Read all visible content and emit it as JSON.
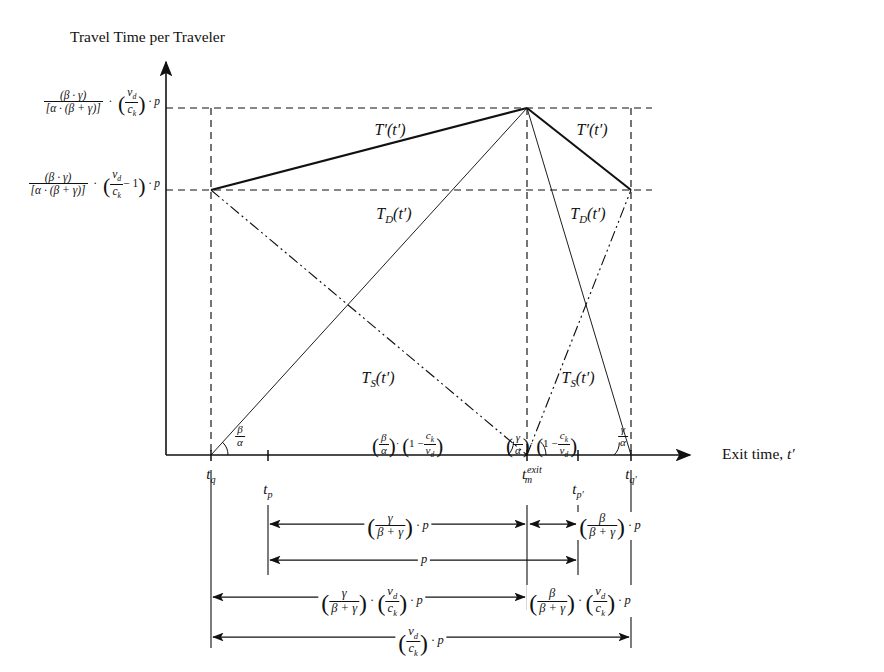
{
  "figure": {
    "domain": "diagram",
    "axes": {
      "y_title": "Travel Time per Traveler",
      "x_title_text": "Exit time, ",
      "x_title_var": "t′"
    },
    "y_ticks": [
      {
        "id": "y-upper",
        "value_desc": "[(β·γ)/(α·(β+γ))]·(v_d/c_k)·p",
        "num": "(β · γ)",
        "den": "[α · (β + γ)]",
        "f2_num": "v",
        "f2_num_sub": "d",
        "f2_den": "c",
        "f2_den_sub": "k",
        "tail": "· p",
        "y_px": 108
      },
      {
        "id": "y-lower",
        "value_desc": "[(β·γ)/(α·(β+γ))]·(v_d/c_k − 1)·p",
        "num": "(β · γ)",
        "den": "[α · (β + γ)]",
        "f2_num": "v",
        "f2_num_sub": "d",
        "f2_den": "c",
        "f2_den_sub": "k",
        "minus_one": "− 1",
        "tail": "· p",
        "y_px": 190
      }
    ],
    "x_ticks": [
      {
        "id": "tq",
        "base": "t",
        "sub": "q",
        "x_px": 211
      },
      {
        "id": "tp",
        "base": "t",
        "sub": "p",
        "x_px": 268
      },
      {
        "id": "tm",
        "base": "t",
        "sub": "m",
        "sup": "exit",
        "x_px": 527
      },
      {
        "id": "tp2",
        "base": "t",
        "sub": "p′",
        "x_px": 578
      },
      {
        "id": "tq2",
        "base": "t",
        "sub": "q′",
        "x_px": 631
      }
    ],
    "curves": [
      {
        "id": "T-prime-left",
        "label_base": "T",
        "label_prime": "′",
        "arg": "(t′)",
        "x_px": 390,
        "y_px": 130
      },
      {
        "id": "T-prime-right",
        "label_base": "T",
        "label_prime": "′",
        "arg": "(t′)",
        "x_px": 592,
        "y_px": 130
      },
      {
        "id": "T-D-left",
        "label_base": "T",
        "label_sub": "D",
        "arg": "(t′)",
        "x_px": 394,
        "y_px": 214
      },
      {
        "id": "T-D-right",
        "label_base": "T",
        "label_sub": "D",
        "arg": "(t′)",
        "x_px": 588,
        "y_px": 214
      },
      {
        "id": "T-S-left",
        "label_base": "T",
        "label_sub": "S",
        "arg": "(t′)",
        "x_px": 378,
        "y_px": 378
      },
      {
        "id": "T-S-right",
        "label_base": "T",
        "label_sub": "S",
        "arg": "(t′)",
        "x_px": 578,
        "y_px": 378
      }
    ],
    "angles": [
      {
        "id": "angle-beta-alpha",
        "num": "β",
        "den": "α",
        "x_px": 238,
        "y_px": 432
      },
      {
        "id": "angle-beta-alpha-scaled",
        "num": "β",
        "den": "α",
        "mult": "·",
        "one": "1 −",
        "f2_num": "c",
        "f2_num_sub": "k",
        "f2_den": "v",
        "f2_den_sub": "d",
        "x_px": 432,
        "y_px": 438
      },
      {
        "id": "angle-gamma-alpha-scaled",
        "num": "γ",
        "den": "α",
        "mult": "·",
        "one": "1 −",
        "f2_num": "c",
        "f2_num_sub": "k",
        "f2_den": "v",
        "f2_den_sub": "d",
        "x_px": 506,
        "y_px": 438
      },
      {
        "id": "angle-gamma-alpha",
        "num": "γ",
        "den": "α",
        "x_px": 618,
        "y_px": 432
      }
    ],
    "dimensions": [
      {
        "id": "dim-gamma-p",
        "row": 1,
        "from_px": 268,
        "to_px": 527,
        "num": "γ",
        "den": "β + γ",
        "tail": "· p",
        "y_px": 524
      },
      {
        "id": "dim-beta-p",
        "row": 1,
        "from_px": 527,
        "to_px": 578,
        "num": "β",
        "den": "β + γ",
        "tail": "· p",
        "y_px": 524
      },
      {
        "id": "dim-p",
        "row": 2,
        "from_px": 268,
        "to_px": 578,
        "plain": "p",
        "y_px": 560
      },
      {
        "id": "dim-gamma-vd-p",
        "row": 3,
        "from_px": 211,
        "to_px": 527,
        "num": "γ",
        "den": "β + γ",
        "f2_num": "v",
        "f2_num_sub": "d",
        "f2_den": "c",
        "f2_den_sub": "k",
        "tail": "· p",
        "y_px": 597
      },
      {
        "id": "dim-beta-vd-p",
        "row": 3,
        "from_px": 527,
        "to_px": 631,
        "num": "β",
        "den": "β + γ",
        "f2_num": "v",
        "f2_num_sub": "d",
        "f2_den": "c",
        "f2_den_sub": "k",
        "tail": "· p",
        "y_px": 597
      },
      {
        "id": "dim-vd-p",
        "row": 4,
        "from_px": 211,
        "to_px": 631,
        "f2_num": "v",
        "f2_num_sub": "d",
        "f2_den": "c",
        "f2_den_sub": "k",
        "tail": "· p",
        "y_px": 637
      }
    ],
    "colors": {
      "ink": "#111111",
      "background": "#ffffff"
    },
    "geometry": {
      "y_axis_x": 166,
      "x_axis_y": 455,
      "peak": {
        "x": 527,
        "y": 108
      },
      "left_shoulder": {
        "x": 211,
        "y": 190
      },
      "right_shoulder": {
        "x": 631,
        "y": 190
      }
    }
  }
}
